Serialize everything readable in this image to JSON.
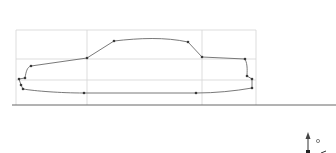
{
  "app": {
    "view": "sketch-viewport",
    "colors": {
      "background": "#ffffff",
      "grid": "#d4d4d4",
      "profile_curve": "#6a6a6a",
      "control_point": "#3a3a3a",
      "ground_line": "#555555",
      "triad": "#333333"
    }
  },
  "sketch": {
    "name": "car-side-profile",
    "control_points_count": 17,
    "construction_grid": {
      "vertical_lines": 4,
      "horizontal_lines": 4
    }
  },
  "triad": {
    "up_axis_icon": "arrow-up-icon",
    "origin_icon": "origin-dot-icon"
  }
}
